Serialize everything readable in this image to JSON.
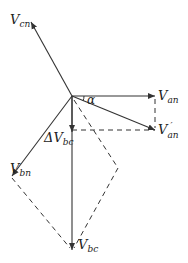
{
  "diagram": {
    "labels": {
      "vcn": {
        "main": "V",
        "sub": "cn"
      },
      "van": {
        "main": "V",
        "sub": "an"
      },
      "van_prime": {
        "main": "V",
        "sub": "an",
        "prime": "′"
      },
      "vbn": {
        "main": "V",
        "sub": "bn"
      },
      "vbc": {
        "main": "V",
        "sub": "bc"
      },
      "delta_vbc": {
        "main": "ΔV",
        "sub": "bc"
      },
      "alpha": "α"
    },
    "colors": {
      "line": "#333333",
      "text": "#222222"
    }
  }
}
